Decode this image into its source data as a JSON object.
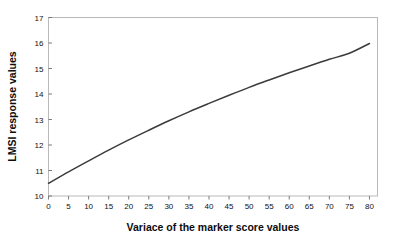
{
  "chart_data": {
    "type": "line",
    "title": "",
    "xlabel": "Variace of the marker score values",
    "ylabel": "LMSI response values",
    "xlim": [
      0,
      82
    ],
    "ylim": [
      10,
      17
    ],
    "grid": false,
    "legend": null,
    "xticks": [
      0,
      5,
      10,
      15,
      20,
      25,
      30,
      35,
      40,
      45,
      50,
      55,
      60,
      65,
      70,
      75,
      80
    ],
    "xtick_labels": [
      "0",
      "5",
      "10",
      "15",
      "20",
      "25",
      "30",
      "35",
      "40",
      "45",
      "50",
      "55",
      "60",
      "65",
      "70",
      "75",
      "80"
    ],
    "yticks": [
      10,
      11,
      12,
      13,
      14,
      15,
      16,
      17
    ],
    "ytick_labels": [
      "10",
      "11",
      "12",
      "13",
      "14",
      "15",
      "16",
      "17"
    ],
    "series": [
      {
        "name": "LMSI response",
        "color": "#3b3b3b",
        "x": [
          0,
          5,
          10,
          15,
          20,
          25,
          30,
          35,
          40,
          45,
          50,
          55,
          60,
          65,
          70,
          75,
          80
        ],
        "y": [
          10.5,
          10.95,
          11.38,
          11.8,
          12.2,
          12.58,
          12.95,
          13.3,
          13.63,
          13.95,
          14.26,
          14.55,
          14.83,
          15.1,
          15.36,
          15.6,
          15.98
        ]
      }
    ]
  },
  "colors": {
    "background": "#ffffff",
    "frame": "#b9b9b9",
    "curve": "#3b3b3b",
    "tick": "#6e6e6e",
    "text": "#111111"
  }
}
